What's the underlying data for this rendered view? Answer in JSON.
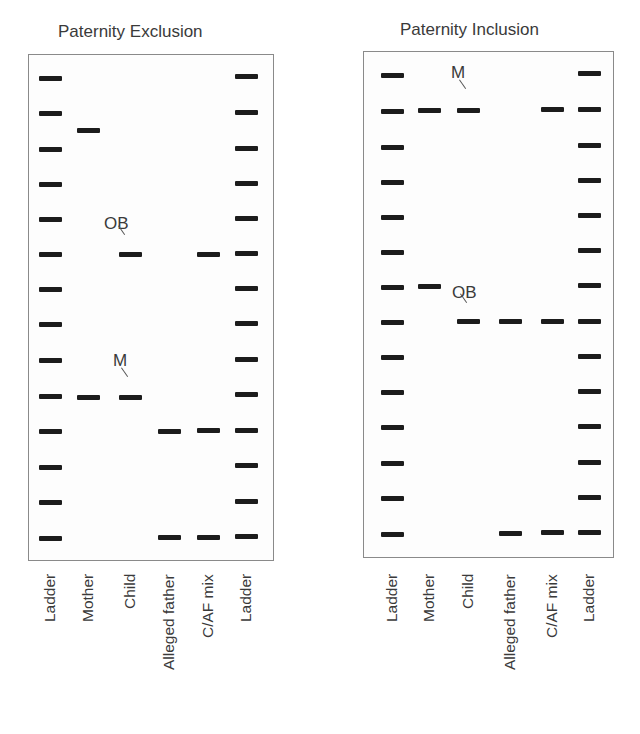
{
  "figure": {
    "panels": [
      {
        "id": "exclusion",
        "title": "Paternity Exclusion",
        "title_pos": {
          "x": 58,
          "y": 22
        },
        "box": {
          "x": 28,
          "y": 54,
          "w": 246,
          "h": 507
        },
        "lanes": [
          {
            "label": "Ladder",
            "x": 50
          },
          {
            "label": "Mother",
            "x": 88
          },
          {
            "label": "Child",
            "x": 130
          },
          {
            "label": "Alleged father",
            "x": 169
          },
          {
            "label": "C/AF mix",
            "x": 208
          },
          {
            "label": "Ladder",
            "x": 246
          }
        ],
        "bands": [
          {
            "lane": 0,
            "y": 78
          },
          {
            "lane": 0,
            "y": 113
          },
          {
            "lane": 0,
            "y": 149
          },
          {
            "lane": 0,
            "y": 184
          },
          {
            "lane": 0,
            "y": 219
          },
          {
            "lane": 0,
            "y": 254
          },
          {
            "lane": 0,
            "y": 289
          },
          {
            "lane": 0,
            "y": 324
          },
          {
            "lane": 0,
            "y": 360
          },
          {
            "lane": 0,
            "y": 396
          },
          {
            "lane": 0,
            "y": 431
          },
          {
            "lane": 0,
            "y": 467
          },
          {
            "lane": 0,
            "y": 502
          },
          {
            "lane": 0,
            "y": 538
          },
          {
            "lane": 1,
            "y": 130
          },
          {
            "lane": 1,
            "y": 397
          },
          {
            "lane": 2,
            "y": 254
          },
          {
            "lane": 2,
            "y": 397
          },
          {
            "lane": 3,
            "y": 431
          },
          {
            "lane": 3,
            "y": 537
          },
          {
            "lane": 4,
            "y": 254
          },
          {
            "lane": 4,
            "y": 430
          },
          {
            "lane": 4,
            "y": 537
          },
          {
            "lane": 5,
            "y": 76
          },
          {
            "lane": 5,
            "y": 112
          },
          {
            "lane": 5,
            "y": 148
          },
          {
            "lane": 5,
            "y": 183
          },
          {
            "lane": 5,
            "y": 218
          },
          {
            "lane": 5,
            "y": 253
          },
          {
            "lane": 5,
            "y": 288
          },
          {
            "lane": 5,
            "y": 323
          },
          {
            "lane": 5,
            "y": 359
          },
          {
            "lane": 5,
            "y": 394
          },
          {
            "lane": 5,
            "y": 430
          },
          {
            "lane": 5,
            "y": 465
          },
          {
            "lane": 5,
            "y": 501
          },
          {
            "lane": 5,
            "y": 536
          }
        ],
        "annotations": [
          {
            "text": "OB",
            "x": 104,
            "y": 215,
            "tick_x": 118,
            "tick_y": 236
          },
          {
            "text": "M",
            "x": 113,
            "y": 352,
            "tick_x": 121,
            "tick_y": 378
          }
        ]
      },
      {
        "id": "inclusion",
        "title": "Paternity Inclusion",
        "title_pos": {
          "x": 400,
          "y": 20
        },
        "box": {
          "x": 363,
          "y": 51,
          "w": 251,
          "h": 507
        },
        "lanes": [
          {
            "label": "Ladder",
            "x": 392
          },
          {
            "label": "Mother",
            "x": 429
          },
          {
            "label": "Child",
            "x": 468
          },
          {
            "label": "Alleged father",
            "x": 510
          },
          {
            "label": "C/AF mix",
            "x": 552
          },
          {
            "label": "Ladder",
            "x": 589
          }
        ],
        "bands": [
          {
            "lane": 0,
            "y": 75
          },
          {
            "lane": 0,
            "y": 111
          },
          {
            "lane": 0,
            "y": 147
          },
          {
            "lane": 0,
            "y": 182
          },
          {
            "lane": 0,
            "y": 217
          },
          {
            "lane": 0,
            "y": 252
          },
          {
            "lane": 0,
            "y": 287
          },
          {
            "lane": 0,
            "y": 322
          },
          {
            "lane": 0,
            "y": 357
          },
          {
            "lane": 0,
            "y": 392
          },
          {
            "lane": 0,
            "y": 427
          },
          {
            "lane": 0,
            "y": 463
          },
          {
            "lane": 0,
            "y": 498
          },
          {
            "lane": 0,
            "y": 534
          },
          {
            "lane": 1,
            "y": 110
          },
          {
            "lane": 1,
            "y": 286
          },
          {
            "lane": 2,
            "y": 110
          },
          {
            "lane": 2,
            "y": 321
          },
          {
            "lane": 3,
            "y": 321
          },
          {
            "lane": 3,
            "y": 533
          },
          {
            "lane": 4,
            "y": 109
          },
          {
            "lane": 4,
            "y": 321
          },
          {
            "lane": 4,
            "y": 532
          },
          {
            "lane": 5,
            "y": 73
          },
          {
            "lane": 5,
            "y": 109
          },
          {
            "lane": 5,
            "y": 145
          },
          {
            "lane": 5,
            "y": 180
          },
          {
            "lane": 5,
            "y": 215
          },
          {
            "lane": 5,
            "y": 250
          },
          {
            "lane": 5,
            "y": 285
          },
          {
            "lane": 5,
            "y": 321
          },
          {
            "lane": 5,
            "y": 356
          },
          {
            "lane": 5,
            "y": 391
          },
          {
            "lane": 5,
            "y": 426
          },
          {
            "lane": 5,
            "y": 462
          },
          {
            "lane": 5,
            "y": 497
          },
          {
            "lane": 5,
            "y": 532
          }
        ],
        "annotations": [
          {
            "text": "M",
            "x": 451,
            "y": 64,
            "tick_x": 459,
            "tick_y": 90
          },
          {
            "text": "OB",
            "x": 452,
            "y": 284,
            "tick_x": 460,
            "tick_y": 304
          }
        ]
      }
    ],
    "band_width": 23,
    "label_top_y": 574,
    "colors": {
      "band": "#1c1c1c",
      "border": "#8a8a8a",
      "text": "#3a3a3a"
    }
  }
}
